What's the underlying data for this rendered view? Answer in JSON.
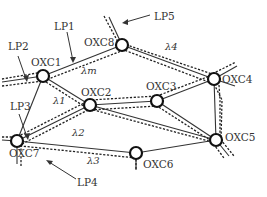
{
  "nodes": [
    {
      "id": "OXC1",
      "label": "OXC1"
    },
    {
      "id": "OXC2",
      "label": "OXC2"
    },
    {
      "id": "OXC3",
      "label": "OXC3"
    },
    {
      "id": "OXC4",
      "label": "OXC4"
    },
    {
      "id": "OXC5",
      "label": "OXC5"
    },
    {
      "id": "OXC6",
      "label": "OXC6"
    },
    {
      "id": "OXC7",
      "label": "OXC7"
    },
    {
      "id": "OXC8",
      "label": "OXC8"
    }
  ],
  "links": [
    [
      "OXC1",
      "OXC8"
    ],
    [
      "OXC8",
      "OXC4"
    ],
    [
      "OXC1",
      "OXC2"
    ],
    [
      "OXC1",
      "OXC7"
    ],
    [
      "OXC2",
      "OXC3"
    ],
    [
      "OXC3",
      "OXC4"
    ],
    [
      "OXC2",
      "OXC7"
    ],
    [
      "OXC7",
      "OXC6"
    ],
    [
      "OXC6",
      "OXC5"
    ],
    [
      "OXC3",
      "OXC5"
    ],
    [
      "OXC4",
      "OXC5"
    ],
    [
      "OXC2",
      "OXC5"
    ]
  ],
  "lightpaths": [
    {
      "id": "LP1",
      "label": "LP1"
    },
    {
      "id": "LP2",
      "label": "LP2"
    },
    {
      "id": "LP3",
      "label": "LP3"
    },
    {
      "id": "LP4",
      "label": "LP4"
    },
    {
      "id": "LP5",
      "label": "LP5"
    }
  ],
  "wavelengths": [
    {
      "id": "lambda1",
      "label": "λ1"
    },
    {
      "id": "lambda2",
      "label": "λ2"
    },
    {
      "id": "lambda3",
      "label": "λ3"
    },
    {
      "id": "lambda4",
      "label": "λ4"
    },
    {
      "id": "lambda_m",
      "label": "λm"
    }
  ]
}
